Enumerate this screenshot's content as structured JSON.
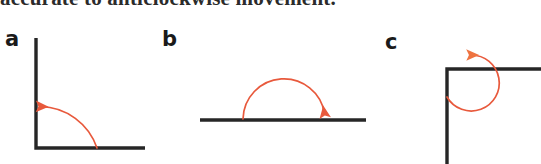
{
  "figure": {
    "cut_off_caption": "accurate to anticlockwise movement.",
    "background_color": "#ffffff",
    "arm_color": "#262626",
    "arrow_color": "#e8593c",
    "panels": [
      {
        "id": "a",
        "label": "a",
        "description": "right angle with vertical arm up and horizontal arm right; orange quarter arc turning anticlockwise from the horizontal arm to the vertical arm",
        "angle_degrees": 90,
        "direction": "anticlockwise",
        "arrow_head": "at vertical arm"
      },
      {
        "id": "b",
        "label": "b",
        "description": "straight horizontal line; orange semicircular arc turning clockwise over the top from left to right",
        "angle_degrees": 180,
        "direction": "clockwise",
        "arrow_head": "at right end of line"
      },
      {
        "id": "c",
        "label": "c",
        "description": "right angle corner with vertical arm down and horizontal arm right; orange reflex arc sweeping anticlockwise around the outside onto the horizontal arm",
        "angle_degrees": 270,
        "direction": "anticlockwise",
        "arrow_head": "pointing down onto horizontal arm"
      }
    ]
  }
}
